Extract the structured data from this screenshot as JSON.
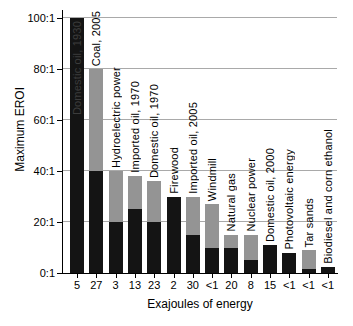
{
  "chart_data": {
    "type": "bar",
    "subtype": "stacked-range-bars",
    "title": "",
    "xlabel": "Exajoules of energy",
    "ylabel": "Maximum EROI",
    "ylim": [
      0,
      100
    ],
    "grid": true,
    "legend": "none",
    "y_ticks": [
      {
        "value": 0,
        "label": "0:1"
      },
      {
        "value": 20,
        "label": "20:1"
      },
      {
        "value": 40,
        "label": "40:1"
      },
      {
        "value": 60,
        "label": "60:1"
      },
      {
        "value": 80,
        "label": "80:1"
      },
      {
        "value": 100,
        "label": "100:1"
      }
    ],
    "categories": [
      "Domestic oil, 1930",
      "Coal, 2005",
      "Hydroelectric power",
      "Imported oil, 1970",
      "Domestic oil, 1970",
      "Firewood",
      "Imported oil, 2005",
      "Windmill",
      "Natural gas",
      "Nuclear power",
      "Domestic oil, 2000",
      "Photovoltaic energy",
      "Tar sands",
      "Biodiesel and corn ethanol"
    ],
    "x_tick_labels": [
      "5",
      "27",
      "3",
      "13",
      "23",
      "2",
      "30",
      "<1",
      "20",
      "8",
      "15",
      "<1",
      "<1",
      "<1"
    ],
    "series": [
      {
        "name": "EROI low estimate (black segment)",
        "values": [
          100,
          40,
          20,
          25,
          20,
          30,
          15,
          10,
          10,
          5,
          11,
          8,
          1.5,
          2.5
        ]
      },
      {
        "name": "EROI high estimate (gray segment top)",
        "values": [
          100,
          80,
          40,
          38,
          36,
          30,
          30,
          27,
          15,
          15,
          11,
          8,
          9,
          2.5
        ]
      }
    ],
    "bars": [
      {
        "label": "Domestic oil, 1930",
        "ej": "5",
        "min": 100,
        "max": 100,
        "label_inside": true
      },
      {
        "label": "Coal, 2005",
        "ej": "27",
        "min": 40,
        "max": 80,
        "label_inside": false
      },
      {
        "label": "Hydroelectric power",
        "ej": "3",
        "min": 20,
        "max": 40,
        "label_inside": false
      },
      {
        "label": "Imported oil, 1970",
        "ej": "13",
        "min": 25,
        "max": 38,
        "label_inside": false
      },
      {
        "label": "Domestic oil, 1970",
        "ej": "23",
        "min": 20,
        "max": 36,
        "label_inside": false
      },
      {
        "label": "Firewood",
        "ej": "2",
        "min": 30,
        "max": 30,
        "label_inside": false
      },
      {
        "label": "Imported oil, 2005",
        "ej": "30",
        "min": 15,
        "max": 30,
        "label_inside": false
      },
      {
        "label": "Windmill",
        "ej": "<1",
        "min": 10,
        "max": 27,
        "label_inside": false
      },
      {
        "label": "Natural gas",
        "ej": "20",
        "min": 10,
        "max": 15,
        "label_inside": false
      },
      {
        "label": "Nuclear power",
        "ej": "8",
        "min": 5,
        "max": 15,
        "label_inside": false
      },
      {
        "label": "Domestic oil, 2000",
        "ej": "15",
        "min": 11,
        "max": 11,
        "label_inside": false
      },
      {
        "label": "Photovoltaic energy",
        "ej": "<1",
        "min": 8,
        "max": 8,
        "label_inside": false
      },
      {
        "label": "Tar sands",
        "ej": "<1",
        "min": 1.5,
        "max": 9,
        "label_inside": false
      },
      {
        "label": "Biodiesel and corn ethanol",
        "ej": "<1",
        "min": 2.5,
        "max": 2.5,
        "label_inside": false
      }
    ],
    "colors": {
      "bar_black": "#141414",
      "bar_gray": "#949494",
      "gridline": "#a9a9a9",
      "axis": "#000000",
      "inside_label_text": "#3c3c3c",
      "background": "#ffffff",
      "text": "#000000"
    }
  }
}
